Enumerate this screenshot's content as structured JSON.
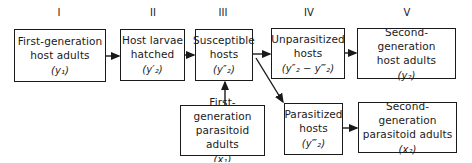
{
  "stages": [
    {
      "id": "I",
      "label": "I"
    },
    {
      "id": "II",
      "label": "II"
    },
    {
      "id": "III",
      "label": "III"
    },
    {
      "id": "IV",
      "label": "IV"
    },
    {
      "id": "V",
      "label": "V"
    }
  ],
  "boxes": {
    "first_gen_host": {
      "line1": "First-generation",
      "line2": "host adults",
      "symbol": "(y₁)"
    },
    "larvae": {
      "line1": "Host larvae",
      "line2": "hatched",
      "symbol": "(y′₂)"
    },
    "susceptible": {
      "line1": "Susceptible",
      "line2": "hosts",
      "symbol": "(y″₂)"
    },
    "unparasitized": {
      "line1": "Unparasitized",
      "line2": "hosts",
      "symbol": "(y″₂ − y‴₂)"
    },
    "second_gen_host": {
      "line1": "Second-generation",
      "line2": "host adults",
      "symbol": "(y₂)"
    },
    "first_gen_parasitoid": {
      "line1": "First-generation",
      "line2": "parasitoid adults",
      "symbol": "(x₁)"
    },
    "parasitized": {
      "line1": "Parasitized",
      "line2": "hosts",
      "symbol": "(y‴₂)"
    },
    "second_gen_parasitoid": {
      "line1": "Second-generation",
      "line2": "parasitoid adults",
      "symbol": "(x₂)"
    }
  }
}
